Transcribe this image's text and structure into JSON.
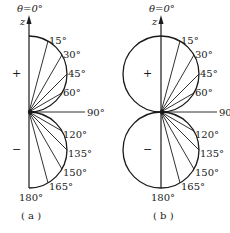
{
  "panels": [
    {
      "id": "a",
      "caption": "( a )",
      "axis_label": "z",
      "top_label": "θ=0°",
      "bottom_label": "180°",
      "upper_sign": "+",
      "lower_sign": "−",
      "shape": "right half only (r = R|cos θ|)",
      "angles": [
        {
          "deg": 15,
          "label": "15°"
        },
        {
          "deg": 30,
          "label": "30°"
        },
        {
          "deg": 45,
          "label": "45°"
        },
        {
          "deg": 60,
          "label": "60°"
        },
        {
          "deg": 90,
          "label": "90°"
        },
        {
          "deg": 120,
          "label": "120°"
        },
        {
          "deg": 135,
          "label": "135°"
        },
        {
          "deg": 150,
          "label": "150°"
        },
        {
          "deg": 165,
          "label": "165°"
        }
      ]
    },
    {
      "id": "b",
      "caption": "( b )",
      "axis_label": "z",
      "top_label": "θ=0°",
      "bottom_label": "180°",
      "upper_sign": "+",
      "lower_sign": "−",
      "shape": "full circles (r = R|cos θ|)",
      "angles": [
        {
          "deg": 15,
          "label": "15°"
        },
        {
          "deg": 30,
          "label": "30°"
        },
        {
          "deg": 45,
          "label": "45°"
        },
        {
          "deg": 60,
          "label": "60°"
        },
        {
          "deg": 90,
          "label": "90°"
        },
        {
          "deg": 120,
          "label": "120°"
        },
        {
          "deg": 135,
          "label": "135°"
        },
        {
          "deg": 150,
          "label": "150°"
        },
        {
          "deg": 165,
          "label": "165°"
        }
      ]
    }
  ],
  "style": {
    "stroke": "#1a1a1a",
    "background": "#ffffff"
  }
}
